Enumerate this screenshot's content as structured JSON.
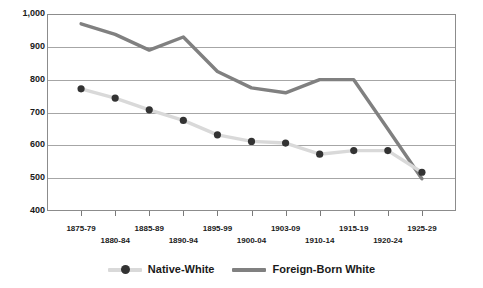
{
  "chart_data": {
    "type": "line",
    "title": "",
    "subtitle": "",
    "xlabel": "",
    "ylabel": "",
    "ylim": [
      400,
      1000
    ],
    "ytick_step": 100,
    "grid": true,
    "legend_position": "bottom",
    "categories": [
      "1875-79",
      "1880-84",
      "1885-89",
      "1890-94",
      "1895-99",
      "1900-04",
      "1903-09",
      "1910-14",
      "1915-19",
      "1920-24",
      "1925-29"
    ],
    "yticks": [
      "400",
      "500",
      "600",
      "700",
      "800",
      "900",
      "1,000"
    ],
    "series": [
      {
        "name": "Native-White",
        "color": "#d9d9d9",
        "marker_color": "#333333",
        "marker": "circle",
        "values": [
          772,
          744,
          708,
          676,
          632,
          612,
          607,
          573,
          584,
          584,
          518
        ]
      },
      {
        "name": "Foreign-Born White",
        "color": "#808080",
        "marker": "none",
        "values": [
          970,
          938,
          890,
          930,
          825,
          775,
          760,
          800,
          800,
          650,
          498
        ]
      }
    ]
  },
  "legend": {
    "items": [
      {
        "label": "Native-White",
        "style": "line-with-marker"
      },
      {
        "label": "Foreign-Born White",
        "style": "line"
      }
    ]
  },
  "colors": {
    "native_white_line": "#d9d9d9",
    "native_white_marker": "#333333",
    "foreign_born_line": "#808080",
    "gridline": "#a6a6a6",
    "axis": "#8c8c8c",
    "text": "#1a1a1a",
    "background": "#ffffff"
  }
}
